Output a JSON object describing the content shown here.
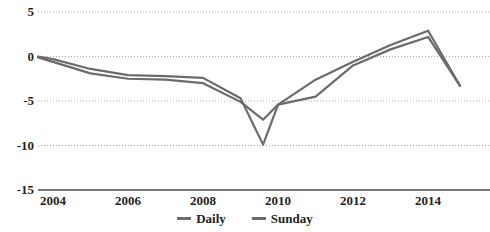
{
  "chart_data": {
    "type": "line",
    "title": "",
    "subtitle": "",
    "xlabel": "",
    "ylabel": "",
    "grid": true,
    "grid_style": "dotted-horizontal",
    "legend_position": "bottom-center",
    "xlim": [
      2003.6,
      2014.85
    ],
    "ylim": [
      -15,
      5
    ],
    "yticks": [
      5,
      0,
      -5,
      -10,
      -15
    ],
    "ytick_labels": [
      "5",
      "0",
      "-5",
      "-10",
      "-15"
    ],
    "xticks": [
      2004,
      2006,
      2008,
      2010,
      2012,
      2014
    ],
    "xtick_labels": [
      "2004",
      "2006",
      "2008",
      "2010",
      "2012",
      "2014"
    ],
    "x": [
      2003.6,
      2004.0,
      2005.0,
      2006.0,
      2007.0,
      2008.0,
      2009.0,
      2009.6,
      2010.0,
      2011.0,
      2012.0,
      2013.0,
      2014.0,
      2014.85
    ],
    "series": [
      {
        "name": "Daily",
        "color": "#6b6b6b",
        "values": [
          -0.1,
          -0.6,
          -1.9,
          -2.5,
          -2.6,
          -3.0,
          -5.1,
          -7.1,
          -5.4,
          -4.5,
          -1.0,
          0.8,
          2.2,
          -3.3
        ]
      },
      {
        "name": "Sunday",
        "color": "#6b6b6b",
        "values": [
          0.0,
          -0.3,
          -1.4,
          -2.1,
          -2.2,
          -2.4,
          -4.7,
          -9.9,
          -5.4,
          -2.6,
          -0.6,
          1.3,
          2.9,
          -3.3
        ]
      }
    ],
    "legend": [
      {
        "label": "Daily",
        "marker": "line-swatch",
        "color": "#6b6b6b"
      },
      {
        "label": "Sunday",
        "marker": "line-swatch",
        "color": "#6b6b6b"
      }
    ],
    "colors": {
      "axis": "#4d4d4d",
      "grid": "#a8a8a8",
      "text": "#231f20",
      "line": "#6b6b6b",
      "background": "#ffffff"
    }
  }
}
